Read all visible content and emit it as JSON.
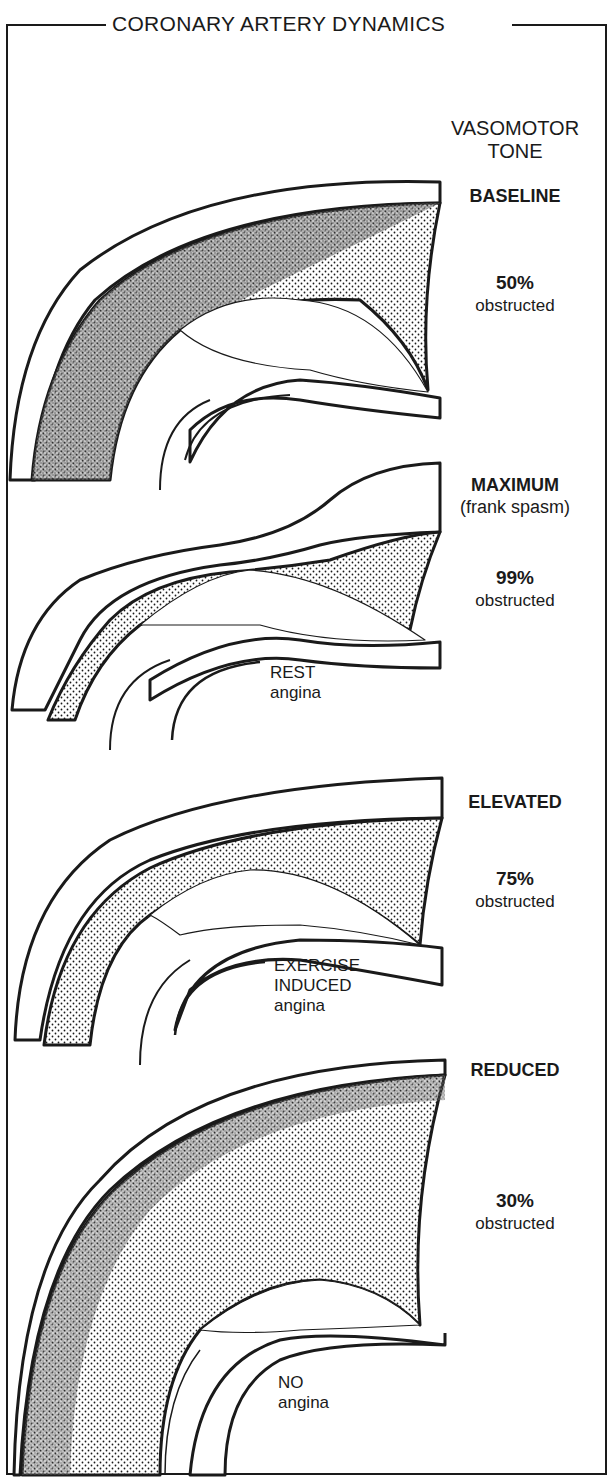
{
  "title": "CORONARY ARTERY DYNAMICS",
  "vasomotor_header": {
    "line1": "VASOMOTOR",
    "line2": "TONE"
  },
  "panels": [
    {
      "tone": "BASELINE",
      "tone_note": "",
      "percent": "50%",
      "obstructed": "obstructed",
      "angina_lines": []
    },
    {
      "tone": "MAXIMUM",
      "tone_note": "(frank spasm)",
      "percent": "99%",
      "obstructed": "obstructed",
      "angina_lines": [
        "REST",
        "angina"
      ]
    },
    {
      "tone": "ELEVATED",
      "tone_note": "",
      "percent": "75%",
      "obstructed": "obstructed",
      "angina_lines": [
        "EXERCISE",
        "INDUCED",
        "angina"
      ]
    },
    {
      "tone": "REDUCED",
      "tone_note": "",
      "percent": "30%",
      "obstructed": "obstructed",
      "angina_lines": [
        "NO",
        "angina"
      ]
    }
  ],
  "colors": {
    "ink": "#1a1a1a",
    "paper": "#ffffff"
  }
}
